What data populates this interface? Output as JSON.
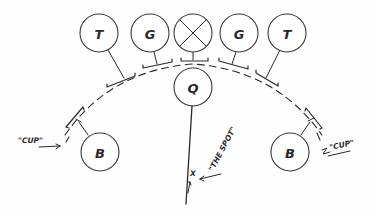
{
  "diagram": {
    "type": "hand-drawn position diagram",
    "colors": {
      "ink": "#2a2a2a",
      "background": "#fefefe"
    },
    "top_row": [
      {
        "id": "t-left",
        "label": "T",
        "cx": 99,
        "cy": 33
      },
      {
        "id": "g-left",
        "label": "G",
        "cx": 150,
        "cy": 33
      },
      {
        "id": "x-center",
        "label": "",
        "symbol": "crossed-circle",
        "cx": 193,
        "cy": 33
      },
      {
        "id": "g-right",
        "label": "G",
        "cx": 239,
        "cy": 33
      },
      {
        "id": "t-right",
        "label": "T",
        "cx": 287,
        "cy": 33
      }
    ],
    "center": {
      "id": "q",
      "label": "Q",
      "cx": 193,
      "cy": 87
    },
    "backs": [
      {
        "id": "b-left",
        "label": "B",
        "cx": 100,
        "cy": 152
      },
      {
        "id": "b-right",
        "label": "B",
        "cx": 290,
        "cy": 152
      }
    ],
    "annotations": {
      "cup_left": "\"CUP\"",
      "cup_right": "\"CUP\"",
      "the_spot": "\"THE SPOT\"",
      "spot_marker": "X"
    }
  }
}
